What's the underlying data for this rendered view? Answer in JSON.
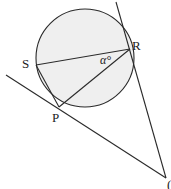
{
  "diagram": {
    "type": "circle-geometry",
    "colors": {
      "stroke": "#2a2a2a",
      "circle_fill": "#efefef",
      "background": "#ffffff",
      "text": "#222222"
    },
    "circle": {
      "cx": 85,
      "cy": 58,
      "r": 49
    },
    "points": {
      "S": {
        "x": 36,
        "y": 65,
        "label": "S"
      },
      "R": {
        "x": 130,
        "y": 48,
        "label": "R"
      },
      "P": {
        "x": 59,
        "y": 107,
        "label": "P"
      },
      "T": {
        "x": 166,
        "y": 178,
        "label": "("
      }
    },
    "angle_label": "α°",
    "labels": {
      "S": "S",
      "R": "R",
      "P": "P",
      "alpha": "α°",
      "bottom_right": "("
    }
  }
}
